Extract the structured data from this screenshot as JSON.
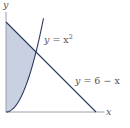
{
  "chart_data": {
    "type": "area",
    "title": "",
    "xlabel": "x",
    "ylabel": "y",
    "xlim": [
      0,
      6.7
    ],
    "ylim": [
      0,
      6.8
    ],
    "grid": false,
    "curves": [
      {
        "name": "parabola",
        "label_var": "y",
        "label_eq": " = x",
        "label_sup": "2",
        "expr": "x^2",
        "domain": [
          0,
          2.5
        ]
      },
      {
        "name": "line",
        "label_var": "y",
        "label_eq": " = 6 − x",
        "expr": "6-x",
        "domain": [
          0,
          6
        ]
      }
    ],
    "shaded_region": {
      "description": "region bounded by y-axis, y = x^2 (below) and y = 6 - x (above)",
      "x_range": [
        0,
        2
      ],
      "lower": "x^2",
      "upper": "6-x",
      "color": "#c9d0e1"
    },
    "intersection": {
      "x": 2,
      "y": 4
    },
    "colors": {
      "curve": "#2a3a5e",
      "axis": "#9aa0a8",
      "fill": "#c9d0e1"
    }
  }
}
